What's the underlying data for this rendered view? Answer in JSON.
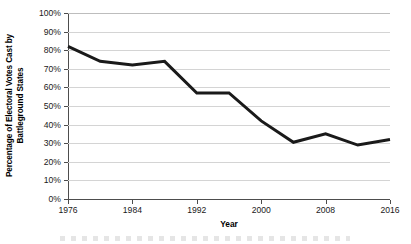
{
  "chart_data": {
    "type": "line",
    "title": "",
    "xlabel": "Year",
    "ylabel": "Percentage of Electoral Votes Cast by Battleground States",
    "ylabel_lines": [
      "Percentage of Electoral Votes Cast by",
      "Battleground States"
    ],
    "x": [
      1976,
      1980,
      1984,
      1988,
      1992,
      1996,
      2000,
      2004,
      2008,
      2012,
      2016
    ],
    "values": [
      82,
      74,
      72,
      74,
      57,
      57,
      42,
      30.5,
      35,
      29,
      32
    ],
    "series": [
      {
        "name": "Percentage of Electoral Votes Cast by Battleground States",
        "values": [
          82,
          74,
          72,
          74,
          57,
          57,
          42,
          30.5,
          35,
          29,
          32
        ]
      }
    ],
    "xlim": [
      1976,
      2016
    ],
    "ylim": [
      0,
      100
    ],
    "y_ticks": [
      0,
      10,
      20,
      30,
      40,
      50,
      60,
      70,
      80,
      90,
      100
    ],
    "y_tick_labels": [
      "0%",
      "10%",
      "20%",
      "30%",
      "40%",
      "50%",
      "60%",
      "70%",
      "80%",
      "90%",
      "100%"
    ],
    "x_ticks": [
      1976,
      1984,
      1992,
      2000,
      2008,
      2016
    ],
    "x_tick_labels": [
      "1976",
      "1984",
      "1992",
      "2000",
      "2008",
      "2016"
    ],
    "grid": true,
    "grid_axis": "y",
    "legend": false,
    "legend_position": "none",
    "line_color": "#1a1a1a",
    "line_width": 3,
    "grid_color": "#d4d4d4",
    "axis_color": "#4d4d4d",
    "background_color": "#ffffff"
  }
}
